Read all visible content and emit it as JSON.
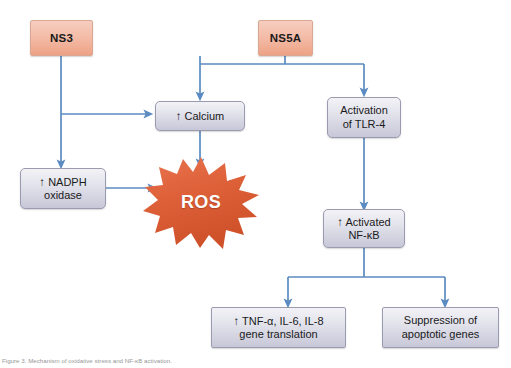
{
  "figure": {
    "caption": "Figure 3. Mechanism of oxidative stress and NF-κB activation.",
    "colors": {
      "viral_fill": "#f2b9a4",
      "viral_border": "#d9a893",
      "effector_fill": "#dcdce8",
      "effector_border": "#9b9bb0",
      "arrow": "#5b8bc0",
      "ros_fill": "#de6139",
      "ros_text": "#ffffff",
      "text": "#1a1a1a"
    }
  },
  "nodes": {
    "ns3": {
      "label": "NS3",
      "type": "viral"
    },
    "ns5a": {
      "label": "NS5A",
      "type": "viral"
    },
    "calcium": {
      "arrow": "↑",
      "label": "Calcium",
      "type": "effector"
    },
    "nadph": {
      "arrow": "↑",
      "line1": "NADPH",
      "line2": "oxidase",
      "type": "effector"
    },
    "ros": {
      "label": "ROS",
      "type": "burst"
    },
    "tlr4": {
      "line1": "Activation",
      "line2": "of TLR-4",
      "type": "effector"
    },
    "nfkb": {
      "arrow": "↑",
      "line1": "Activated",
      "line2": "NF-κB",
      "type": "effector"
    },
    "cytokines": {
      "arrow": "↑",
      "line1": "TNF-α, IL-6, IL-8",
      "line2": "gene translation",
      "type": "effector"
    },
    "apoptosis": {
      "line1": "Suppression of",
      "line2": "apoptotic genes",
      "type": "effector"
    }
  },
  "edges": [
    {
      "from": "ns3",
      "to": "nadph",
      "style": "straight-down"
    },
    {
      "from": "ns3",
      "to": "calcium",
      "style": "branch-right"
    },
    {
      "from": "ns5a",
      "to": "calcium",
      "style": "split-left"
    },
    {
      "from": "ns5a",
      "to": "tlr4",
      "style": "split-right"
    },
    {
      "from": "calcium",
      "to": "ros",
      "style": "straight-down"
    },
    {
      "from": "nadph",
      "to": "ros",
      "style": "straight-right"
    },
    {
      "from": "tlr4",
      "to": "nfkb",
      "style": "straight-down"
    },
    {
      "from": "nfkb",
      "to": "cytokines",
      "style": "split-left"
    },
    {
      "from": "nfkb",
      "to": "apoptosis",
      "style": "split-right"
    }
  ]
}
